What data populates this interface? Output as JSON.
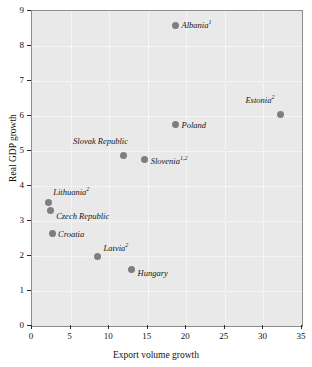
{
  "chart_data": {
    "type": "scatter",
    "title": "",
    "xlabel": "Export volume growth",
    "ylabel": "Real GDP growth",
    "xlim": [
      0,
      35
    ],
    "ylim": [
      0,
      9
    ],
    "xticks": [
      "0",
      "5",
      "10",
      "15",
      "20",
      "25",
      "30",
      "35"
    ],
    "yticks": [
      "0",
      "1",
      "2",
      "3",
      "4",
      "5",
      "6",
      "7",
      "8",
      "9"
    ],
    "grid": true,
    "legend": "none",
    "marker_color": "#7e7e7e",
    "plot_background": "#e9e9e9",
    "gridline_color": "#ffffff",
    "points": [
      {
        "label": "Albania",
        "footnote": "1",
        "x": 18.6,
        "y": 8.6,
        "label_side": "right",
        "label_dx": 6,
        "label_dy": 0
      },
      {
        "label": "Estonia",
        "footnote": "2",
        "x": 32.2,
        "y": 6.03,
        "label_side": "left",
        "label_dx": -6,
        "label_dy": -15
      },
      {
        "label": "Poland",
        "footnote": "",
        "x": 18.6,
        "y": 5.75,
        "label_side": "right",
        "label_dx": 6,
        "label_dy": 0
      },
      {
        "label": "Slovak Republic",
        "footnote": "",
        "x": 11.8,
        "y": 4.88,
        "label_side": "left",
        "label_dx": 5,
        "label_dy": -14
      },
      {
        "label": "Slovenia",
        "footnote": "1,2",
        "x": 14.6,
        "y": 4.75,
        "label_side": "right",
        "label_dx": 6,
        "label_dy": 1
      },
      {
        "label": "Lithuania",
        "footnote": "2",
        "x": 2.1,
        "y": 3.52,
        "label_side": "right",
        "label_dx": 5,
        "label_dy": -11
      },
      {
        "label": "Czech Republic",
        "footnote": "",
        "x": 2.35,
        "y": 3.3,
        "label_side": "right",
        "label_dx": 6,
        "label_dy": 5
      },
      {
        "label": "Croatia",
        "footnote": "",
        "x": 2.6,
        "y": 2.65,
        "label_side": "right",
        "label_dx": 6,
        "label_dy": 1
      },
      {
        "label": "Latvia",
        "footnote": "2",
        "x": 8.5,
        "y": 2.0,
        "label_side": "right",
        "label_dx": 6,
        "label_dy": -8
      },
      {
        "label": "Hungary",
        "footnote": "",
        "x": 12.9,
        "y": 1.62,
        "label_side": "right",
        "label_dx": 6,
        "label_dy": 4
      }
    ]
  }
}
